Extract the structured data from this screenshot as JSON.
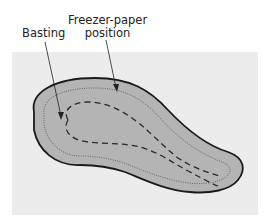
{
  "diagram": {
    "labels": {
      "basting": "Basting",
      "freezer_paper_line1": "Freezer-paper",
      "freezer_paper_line2": "position"
    },
    "colors": {
      "panel": "#ececec",
      "shape_fill": "#b4b4b4",
      "outline": "#1a1a1a",
      "dotted_line": "#5a5a5a",
      "dashed_line": "#2a2a2a"
    }
  }
}
